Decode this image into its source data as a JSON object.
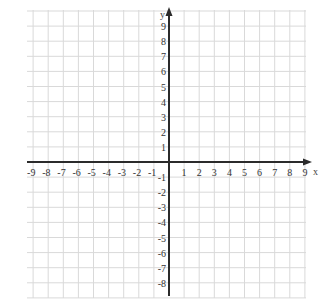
{
  "diagram": {
    "type": "coordinate-plane",
    "x_axis": {
      "label": "x",
      "min": -9,
      "max": 9,
      "tick_labels": [
        "-9",
        "-8",
        "-7",
        "-6",
        "-5",
        "-4",
        "-3",
        "-2",
        "-1",
        "1",
        "2",
        "3",
        "4",
        "5",
        "6",
        "7",
        "8",
        "9"
      ]
    },
    "y_axis": {
      "label": "y",
      "min": -8,
      "max": 9,
      "tick_labels": [
        "9",
        "8",
        "7",
        "6",
        "5",
        "4",
        "3",
        "2",
        "1",
        "-1",
        "-2",
        "-3",
        "-4",
        "-5",
        "-6",
        "-7",
        "-8"
      ]
    },
    "grid": {
      "x_range": [
        -9.5,
        9
      ],
      "y_range": [
        -9,
        10
      ],
      "step": 1
    },
    "colors": {
      "grid": "#d9d9d9",
      "axis": "#2b2b2b",
      "label": "#333333",
      "background": "#ffffff"
    }
  }
}
